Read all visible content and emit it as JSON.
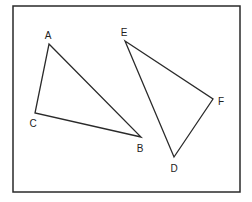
{
  "diagram": {
    "type": "geometry-triangles",
    "colors": {
      "background": "#ffffff",
      "stroke": "#2a2a2a",
      "text": "#222222"
    },
    "frame": {
      "x": 13,
      "y": 6,
      "width": 227,
      "height": 186
    },
    "triangles": [
      {
        "name": "ABC",
        "vertices": [
          {
            "label": "A",
            "x": 49,
            "y": 44,
            "label_x": 48,
            "label_y": 39
          },
          {
            "label": "B",
            "x": 141,
            "y": 137,
            "label_x": 140,
            "label_y": 152
          },
          {
            "label": "C",
            "x": 35,
            "y": 113,
            "label_x": 33,
            "label_y": 127
          }
        ]
      },
      {
        "name": "DEF",
        "vertices": [
          {
            "label": "E",
            "x": 125,
            "y": 41,
            "label_x": 124,
            "label_y": 36
          },
          {
            "label": "F",
            "x": 213,
            "y": 99,
            "label_x": 221,
            "label_y": 105
          },
          {
            "label": "D",
            "x": 174,
            "y": 157,
            "label_x": 174,
            "label_y": 172
          }
        ]
      }
    ]
  }
}
